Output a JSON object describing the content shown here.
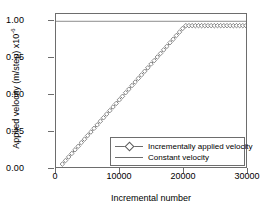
{
  "chart_data": {
    "type": "line",
    "title": "",
    "xlabel": "Incremental number",
    "ylabel_text": "Applied velocity (m/step) x10",
    "ylabel_exponent": "-6",
    "xlim": [
      0,
      30000
    ],
    "ylim": [
      0.0,
      1.05
    ],
    "xticks": [
      0,
      10000,
      20000,
      30000
    ],
    "xticklabels": [
      "0",
      "10000",
      "20000",
      "30000"
    ],
    "yticks": [
      0.0,
      0.25,
      0.5,
      0.75,
      1.0
    ],
    "yticklabels": [
      "0.00",
      "0.25",
      "0.50",
      "0.75",
      "1.00"
    ],
    "grid": false,
    "legend_position": "lower-right",
    "series": [
      {
        "name": "Incrementally applied velocity",
        "marker": "open-diamond",
        "color": "#5a5a5a",
        "x": [
          1000,
          1500,
          2000,
          2500,
          3000,
          3500,
          4000,
          4500,
          5000,
          5500,
          6000,
          6500,
          7000,
          7500,
          8000,
          8500,
          9000,
          9500,
          10000,
          10500,
          11000,
          11500,
          12000,
          12500,
          13000,
          13500,
          14000,
          14500,
          15000,
          15500,
          16000,
          16500,
          17000,
          17500,
          18000,
          18500,
          19000,
          19500,
          20000,
          20500,
          21000,
          21500,
          22000,
          22500,
          23000,
          23500,
          24000,
          24500,
          25000,
          25500,
          26000,
          26500,
          27000,
          27500,
          28000,
          28500,
          29000,
          29500,
          30000
        ],
        "y": [
          0.02,
          0.044,
          0.069,
          0.093,
          0.118,
          0.142,
          0.167,
          0.191,
          0.216,
          0.24,
          0.265,
          0.289,
          0.314,
          0.338,
          0.363,
          0.387,
          0.412,
          0.436,
          0.461,
          0.485,
          0.51,
          0.534,
          0.559,
          0.583,
          0.608,
          0.632,
          0.657,
          0.681,
          0.706,
          0.73,
          0.755,
          0.779,
          0.804,
          0.828,
          0.853,
          0.877,
          0.902,
          0.926,
          0.951,
          0.97,
          0.97,
          0.97,
          0.97,
          0.97,
          0.97,
          0.97,
          0.97,
          0.97,
          0.97,
          0.97,
          0.97,
          0.97,
          0.97,
          0.97,
          0.97,
          0.97,
          0.97,
          0.97,
          0.97
        ]
      },
      {
        "name": "Constant velocity",
        "marker": "none",
        "color": "#6d6d6d",
        "x": [
          0,
          30000
        ],
        "y": [
          1.0,
          1.0
        ]
      }
    ]
  },
  "legend": {
    "items": [
      {
        "label": "Incrementally applied velocity"
      },
      {
        "label": "Constant velocity"
      }
    ]
  }
}
